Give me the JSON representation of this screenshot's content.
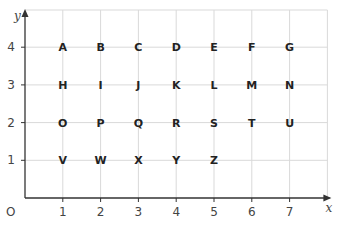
{
  "diagram": {
    "type": "coordinate-grid",
    "x_axis": {
      "label": "x",
      "ticks": [
        "1",
        "2",
        "3",
        "4",
        "5",
        "6",
        "7"
      ]
    },
    "y_axis": {
      "label": "y",
      "ticks": [
        "1",
        "2",
        "3",
        "4"
      ]
    },
    "origin_label": "O",
    "colors": {
      "grid": "#d9d9d9",
      "axis": "#333333",
      "text": "#222222"
    },
    "points": [
      {
        "label": "A",
        "x": 1,
        "y": 4
      },
      {
        "label": "B",
        "x": 2,
        "y": 4
      },
      {
        "label": "C",
        "x": 3,
        "y": 4
      },
      {
        "label": "D",
        "x": 4,
        "y": 4
      },
      {
        "label": "E",
        "x": 5,
        "y": 4
      },
      {
        "label": "F",
        "x": 6,
        "y": 4
      },
      {
        "label": "G",
        "x": 7,
        "y": 4
      },
      {
        "label": "H",
        "x": 1,
        "y": 3
      },
      {
        "label": "I",
        "x": 2,
        "y": 3
      },
      {
        "label": "J",
        "x": 3,
        "y": 3
      },
      {
        "label": "K",
        "x": 4,
        "y": 3
      },
      {
        "label": "L",
        "x": 5,
        "y": 3
      },
      {
        "label": "M",
        "x": 6,
        "y": 3
      },
      {
        "label": "N",
        "x": 7,
        "y": 3
      },
      {
        "label": "O",
        "x": 1,
        "y": 2
      },
      {
        "label": "P",
        "x": 2,
        "y": 2
      },
      {
        "label": "Q",
        "x": 3,
        "y": 2
      },
      {
        "label": "R",
        "x": 4,
        "y": 2
      },
      {
        "label": "S",
        "x": 5,
        "y": 2
      },
      {
        "label": "T",
        "x": 6,
        "y": 2
      },
      {
        "label": "U",
        "x": 7,
        "y": 2
      },
      {
        "label": "V",
        "x": 1,
        "y": 1
      },
      {
        "label": "W",
        "x": 2,
        "y": 1
      },
      {
        "label": "X",
        "x": 3,
        "y": 1
      },
      {
        "label": "Y",
        "x": 4,
        "y": 1
      },
      {
        "label": "Z",
        "x": 5,
        "y": 1
      }
    ]
  }
}
